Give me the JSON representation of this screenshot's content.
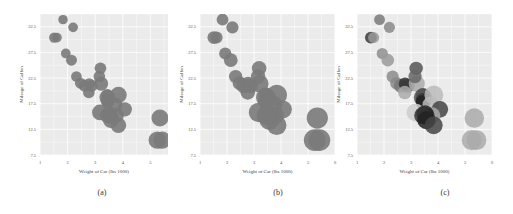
{
  "chart_data": [
    {
      "type": "scatter",
      "panel_label": "(a)",
      "xlabel": "Weight of Car (lbs 1000)",
      "ylabel": "Mileage of Gallon",
      "x_ticks": [
        "1",
        "2",
        "3",
        "4",
        "5",
        "6"
      ],
      "y_ticks": [
        "7.5",
        "12.5",
        "17.5",
        "22.5",
        "27.5",
        "32.5"
      ],
      "xlim": [
        1,
        6
      ],
      "ylim": [
        7.5,
        35
      ],
      "grid": true,
      "marker_color": "#7a7a7a",
      "encoding": "bubble size by engine displacement, uniform gray",
      "points": [
        {
          "x": 1.835,
          "y": 33.9,
          "s": 71.1
        },
        {
          "x": 2.2,
          "y": 32.4,
          "s": 78.7
        },
        {
          "x": 1.513,
          "y": 30.4,
          "s": 95.1
        },
        {
          "x": 1.615,
          "y": 30.4,
          "s": 75.7
        },
        {
          "x": 1.935,
          "y": 27.3,
          "s": 79
        },
        {
          "x": 2.14,
          "y": 26,
          "s": 120.3
        },
        {
          "x": 2.32,
          "y": 22.8,
          "s": 108
        },
        {
          "x": 3.19,
          "y": 24.4,
          "s": 146.7
        },
        {
          "x": 2.465,
          "y": 21.5,
          "s": 120.1
        },
        {
          "x": 2.62,
          "y": 21,
          "s": 160
        },
        {
          "x": 2.875,
          "y": 21,
          "s": 160
        },
        {
          "x": 2.78,
          "y": 21.4,
          "s": 121
        },
        {
          "x": 3.215,
          "y": 21.4,
          "s": 258
        },
        {
          "x": 3.15,
          "y": 22.8,
          "s": 140.8
        },
        {
          "x": 2.77,
          "y": 19.7,
          "s": 145
        },
        {
          "x": 3.44,
          "y": 19.2,
          "s": 167.6
        },
        {
          "x": 3.44,
          "y": 18.7,
          "s": 360
        },
        {
          "x": 3.46,
          "y": 18.1,
          "s": 225
        },
        {
          "x": 3.44,
          "y": 17.8,
          "s": 167.6
        },
        {
          "x": 3.73,
          "y": 17.3,
          "s": 275.8
        },
        {
          "x": 3.845,
          "y": 19.2,
          "s": 400
        },
        {
          "x": 4.07,
          "y": 16.4,
          "s": 275.8
        },
        {
          "x": 3.78,
          "y": 15.2,
          "s": 275.8
        },
        {
          "x": 3.57,
          "y": 15,
          "s": 301
        },
        {
          "x": 3.17,
          "y": 15.8,
          "s": 351
        },
        {
          "x": 3.52,
          "y": 15.5,
          "s": 318
        },
        {
          "x": 3.435,
          "y": 15.2,
          "s": 304
        },
        {
          "x": 3.57,
          "y": 14.3,
          "s": 360
        },
        {
          "x": 3.84,
          "y": 13.3,
          "s": 350
        },
        {
          "x": 5.345,
          "y": 14.7,
          "s": 440
        },
        {
          "x": 5.25,
          "y": 10.4,
          "s": 472
        },
        {
          "x": 5.424,
          "y": 10.4,
          "s": 460
        }
      ]
    },
    {
      "type": "scatter",
      "panel_label": "(b)",
      "xlabel": "Weight of Car (lbs 1000)",
      "ylabel": "Mileage of Gallon",
      "x_ticks": [
        "1",
        "2",
        "3",
        "4",
        "5",
        "6"
      ],
      "y_ticks": [
        "7.5",
        "12.5",
        "17.5",
        "22.5",
        "27.5",
        "32.5"
      ],
      "xlim": [
        1,
        6
      ],
      "ylim": [
        7.5,
        35
      ],
      "grid": true,
      "marker_color": "#7a7a7a",
      "encoding": "bubble size by engine displacement, uniform gray, larger markers",
      "points_ref": "same as panel (a)"
    },
    {
      "type": "scatter",
      "panel_label": "(c)",
      "xlabel": "Weight of Car (lbs 1000)",
      "ylabel": "Mileage of Gallon",
      "x_ticks": [
        "1",
        "2",
        "3",
        "4",
        "5",
        "6"
      ],
      "y_ticks": [
        "7.5",
        "12.5",
        "17.5",
        "22.5",
        "27.5",
        "32.5"
      ],
      "xlim": [
        1,
        6
      ],
      "ylim": [
        7.5,
        35
      ],
      "grid": true,
      "encoding": "bubble size by displacement, gray shade varies (third variable)",
      "points_ref": "same as panel (a)",
      "shades": [
        "#7a7a7a",
        "#8a8a8a",
        "#3a3a3a",
        "#999999",
        "#8f8f8f",
        "#9a9a9a",
        "#8c8c8c",
        "#555555",
        "#8a8a8a",
        "#777777",
        "#666666",
        "#333333",
        "#aaaaaa",
        "#666666",
        "#aaaaaa",
        "#444444",
        "#555555",
        "#333333",
        "#222222",
        "#bbbbbb",
        "#bbbbbb",
        "#444444",
        "#aaaaaa",
        "#444444",
        "#cccccc",
        "#222222",
        "#333333",
        "#222222",
        "#444444",
        "#aaaaaa",
        "#aaaaaa",
        "#aaaaaa"
      ]
    }
  ],
  "captions": {
    "a": "(a)",
    "b": "(b)",
    "c": "(c)"
  }
}
